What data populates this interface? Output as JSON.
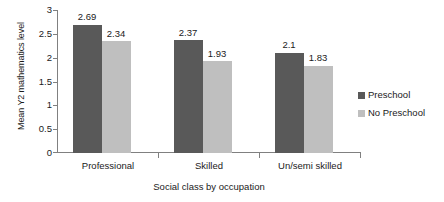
{
  "chart_data": {
    "type": "bar",
    "title": "",
    "subtitle": "",
    "xlabel": "Social class by occupation",
    "ylabel": "Mean Y2 mathematics level",
    "categories": [
      "Professional",
      "Skilled",
      "Un/semi skilled"
    ],
    "series": [
      {
        "name": "Preschool",
        "values": [
          2.69,
          2.37,
          2.1
        ],
        "labels": [
          "2.69",
          "2.37",
          "2.1"
        ],
        "color": "#595959"
      },
      {
        "name": "No Preschool",
        "values": [
          2.34,
          1.93,
          1.83
        ],
        "labels": [
          "2.34",
          "1.93",
          "1.83"
        ],
        "color": "#bfbfbf"
      }
    ],
    "ylim": [
      0,
      3
    ],
    "ytick_labels": [
      "3",
      "2.5",
      "2",
      "1.5",
      "1",
      "0.5",
      "0"
    ],
    "ytick_values": [
      3,
      2.5,
      2,
      1.5,
      1,
      0.5,
      0
    ],
    "grid": false,
    "legend_position": "right",
    "axis_color": "#808080",
    "background": "#ffffff"
  }
}
